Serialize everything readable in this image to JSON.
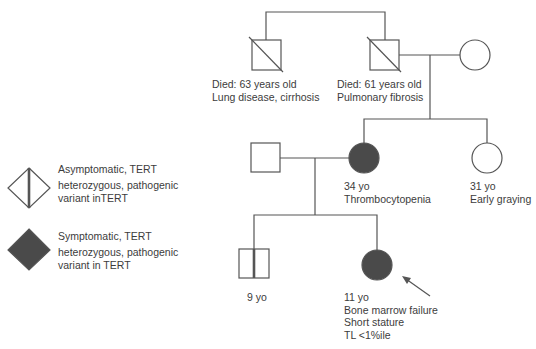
{
  "colors": {
    "line": "#555555",
    "affected_fill": "#4a4a4a",
    "background": "#ffffff"
  },
  "legend": [
    {
      "symbol": "diamond-with-vertical-line",
      "line1": "Asymptomatic, TERT",
      "line2": "heterozygous, pathogenic",
      "line3": "variant inTERT"
    },
    {
      "symbol": "filled-diamond",
      "line1": "Symptomatic, TERT",
      "line2": "heterozygous, pathogenic",
      "line3": "variant in TERT"
    }
  ],
  "generation1": {
    "uncle": {
      "sex": "male",
      "status": "deceased",
      "line1": "Died: 63 years old",
      "line2": "Lung disease, cirrhosis"
    },
    "grandfather": {
      "sex": "male",
      "status": "deceased",
      "line1": "Died: 61 years old",
      "line2": "Pulmonary fibrosis"
    },
    "grandmother": {
      "sex": "female",
      "status": "unaffected"
    }
  },
  "generation2": {
    "father": {
      "sex": "male",
      "status": "unaffected"
    },
    "mother": {
      "sex": "female",
      "status": "symptomatic",
      "line1": "34 yo",
      "line2": "Thrombocytopenia"
    },
    "aunt": {
      "sex": "female",
      "status": "unaffected",
      "line1": "31 yo",
      "line2": "Early graying"
    }
  },
  "generation3": {
    "brother": {
      "sex": "male",
      "status": "asymptomatic carrier",
      "line1": "9 yo"
    },
    "proband": {
      "sex": "female",
      "status": "symptomatic",
      "line1": "11 yo",
      "line2": "Bone marrow failure",
      "line3": "Short stature",
      "line4": "TL <1%ile",
      "marker": "arrow"
    }
  }
}
